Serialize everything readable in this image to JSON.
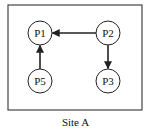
{
  "diagram": {
    "caption": "Site A",
    "frame": {
      "x": 8,
      "y": 5,
      "width": 134,
      "height": 105,
      "stroke": "#444444"
    },
    "node_radius": 12,
    "nodes": [
      {
        "id": "P1",
        "label": "P1",
        "cx": 40,
        "cy": 33
      },
      {
        "id": "P2",
        "label": "P2",
        "cx": 108,
        "cy": 33
      },
      {
        "id": "P5",
        "label": "P5",
        "cx": 40,
        "cy": 81
      },
      {
        "id": "P3",
        "label": "P3",
        "cx": 108,
        "cy": 81
      }
    ],
    "edges": [
      {
        "from": "P2",
        "to": "P1",
        "directed": true
      },
      {
        "from": "P5",
        "to": "P1",
        "directed": true
      },
      {
        "from": "P2",
        "to": "P3",
        "directed": true
      }
    ],
    "colors": {
      "stroke": "#222222",
      "node_fill": "#ffffff",
      "text": "#111111"
    }
  }
}
